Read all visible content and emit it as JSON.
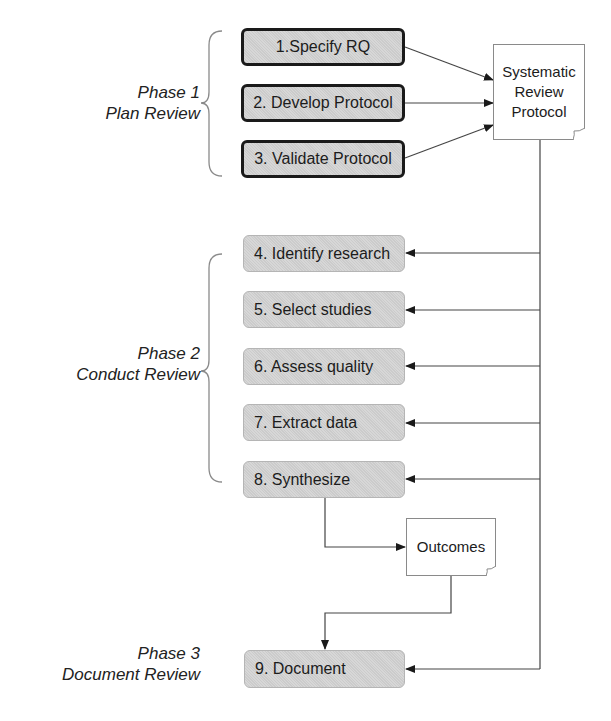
{
  "diagram": {
    "phases": [
      {
        "title": "Phase 1",
        "subtitle": "Plan Review"
      },
      {
        "title": "Phase 2",
        "subtitle": "Conduct Review"
      },
      {
        "title": "Phase 3",
        "subtitle": "Document Review"
      }
    ],
    "steps": [
      {
        "label": "1.Specify RQ"
      },
      {
        "label": "2. Develop Protocol"
      },
      {
        "label": "3. Validate Protocol"
      },
      {
        "label": "4. Identify research"
      },
      {
        "label": "5. Select studies"
      },
      {
        "label": "6. Assess quality"
      },
      {
        "label": "7. Extract data"
      },
      {
        "label": "8. Synthesize"
      },
      {
        "label": "9. Document"
      }
    ],
    "documents": {
      "protocol": {
        "line1": "Systematic",
        "line2": "Review",
        "line3": "Protocol"
      },
      "outcomes": {
        "label": "Outcomes"
      }
    },
    "colors": {
      "box_fill": "#d2d2d2",
      "bold_border": "#1a1a1a",
      "light_border": "#b5b5b5",
      "connector": "#333333",
      "brace": "#8a8a8a"
    }
  }
}
